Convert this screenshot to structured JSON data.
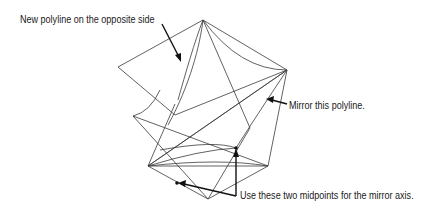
{
  "labels": {
    "new_polyline": "New polyline on the opposite side",
    "mirror_polyline": "Mirror this polyline.",
    "midpoints": "Use these two midpoints for the mirror axis."
  },
  "colors": {
    "line": "#3a3a3a",
    "callout": "#111111",
    "background": "#ffffff"
  }
}
